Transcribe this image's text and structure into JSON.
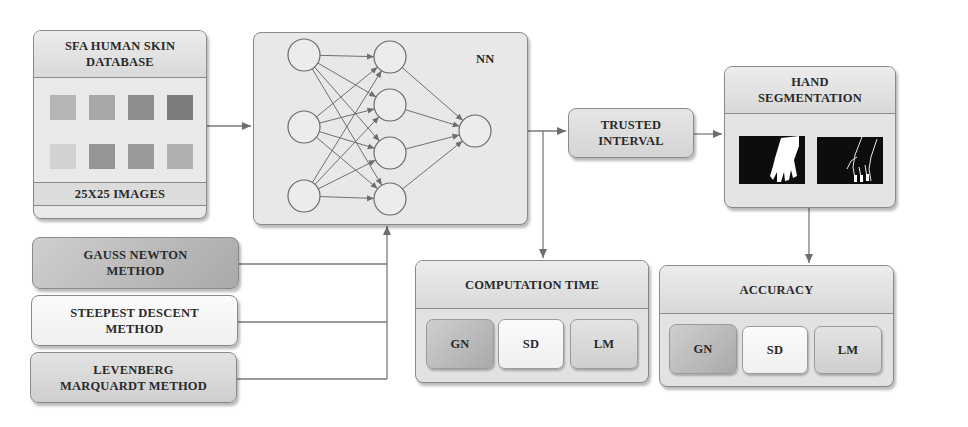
{
  "diagram": {
    "database": {
      "title": "SFA HUMAN SKIN DATABASE",
      "title_line1": "SFA HUMAN SKIN",
      "title_line2": "DATABASE",
      "footer": "25X25 IMAGES",
      "sample_tones": [
        "#b5b5b5",
        "#a8a8a8",
        "#8e8e8e",
        "#7c7c7c",
        "#d2d2d2",
        "#959595",
        "#9a9a9a",
        "#b0b0b0"
      ]
    },
    "network": {
      "title": "NN",
      "layers": [
        3,
        4,
        1
      ]
    },
    "trusted_interval": {
      "line1": "TRUSTED",
      "line2": "INTERVAL"
    },
    "hand_segmentation": {
      "line1": "HAND",
      "line2": "SEGMENTATION",
      "images": [
        "hand-mask-image",
        "hand-edges-image"
      ]
    },
    "methods": [
      {
        "line1": "GAUSS NEWTON",
        "line2": "METHOD",
        "tone": "dark"
      },
      {
        "line1": "STEEPEST DESCENT",
        "line2": "METHOD",
        "tone": "light"
      },
      {
        "line1": "LEVENBERG",
        "line2": "MARQUARDT METHOD",
        "tone": "mid"
      }
    ],
    "computation_time": {
      "title": "COMPUTATION TIME",
      "cells": [
        "GN",
        "SD",
        "LM"
      ]
    },
    "accuracy": {
      "title": "ACCURACY",
      "cells": [
        "GN",
        "SD",
        "LM"
      ]
    }
  }
}
